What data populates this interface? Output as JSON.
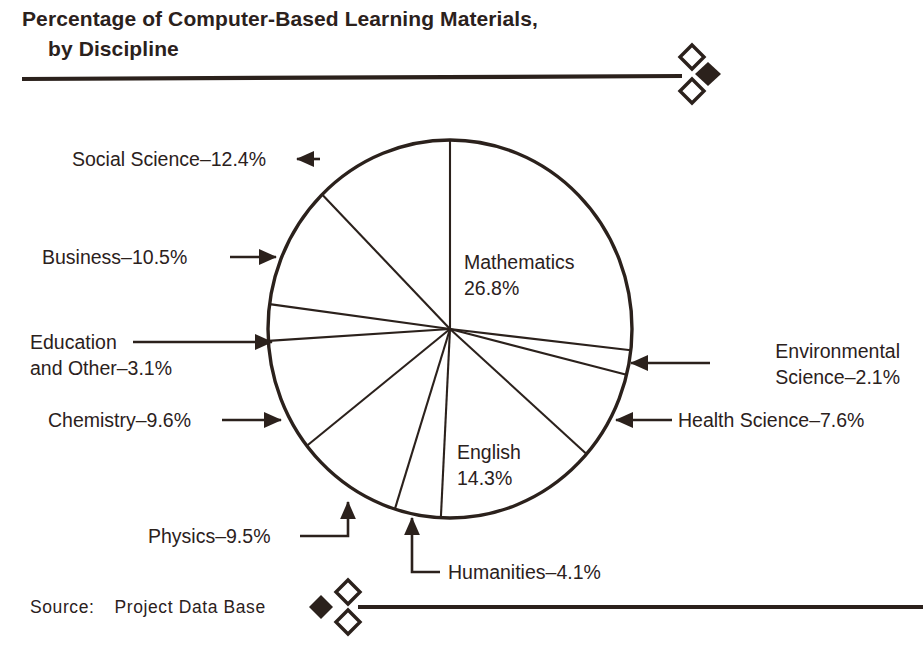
{
  "title": {
    "line1": "Percentage of Computer-Based Learning Materials,",
    "line2": "by Discipline"
  },
  "source": {
    "label": "Source:",
    "value": "Project Data Base"
  },
  "ornaments": {
    "top": "diamond-rule-ornament",
    "bottom": "diamond-rule-ornament"
  },
  "colors": {
    "ink": "#2b211c",
    "background": "#ffffff"
  },
  "chart_data": {
    "type": "pie",
    "title": "Percentage of Computer-Based Learning Materials, by Discipline",
    "subtitle": "",
    "xlabel": "",
    "ylabel": "",
    "units": "percent",
    "start_angle_deg": 0,
    "direction": "clockwise",
    "legend": "none",
    "labels_inside": [
      "Mathematics",
      "English"
    ],
    "categories": [
      "Mathematics",
      "Environmental Science",
      "Health Science",
      "English",
      "Humanities",
      "Physics",
      "Chemistry",
      "Education and Other",
      "Business",
      "Social Science"
    ],
    "values": [
      26.8,
      2.1,
      7.6,
      14.3,
      4.1,
      9.5,
      9.6,
      3.1,
      10.5,
      12.4
    ],
    "slices": [
      {
        "name": "Mathematics",
        "value": 26.8,
        "label": "Mathematics",
        "value_label": "26.8%",
        "callout": "inside"
      },
      {
        "name": "Environmental Science",
        "value": 2.1,
        "label": "Environmental",
        "value_label": "Science–2.1%",
        "callout": "right"
      },
      {
        "name": "Health Science",
        "value": 7.6,
        "label": "Health Science–7.6%",
        "value_label": "7.6%",
        "callout": "right"
      },
      {
        "name": "English",
        "value": 14.3,
        "label": "English",
        "value_label": "14.3%",
        "callout": "inside"
      },
      {
        "name": "Humanities",
        "value": 4.1,
        "label": "Humanities–4.1%",
        "value_label": "4.1%",
        "callout": "bottom"
      },
      {
        "name": "Physics",
        "value": 9.5,
        "label": "Physics–9.5%",
        "value_label": "9.5%",
        "callout": "bottom-left"
      },
      {
        "name": "Chemistry",
        "value": 9.6,
        "label": "Chemistry–9.6%",
        "value_label": "9.6%",
        "callout": "left"
      },
      {
        "name": "Education and Other",
        "value": 3.1,
        "label": "Education",
        "value_label": "and Other–3.1%",
        "callout": "left"
      },
      {
        "name": "Business",
        "value": 10.5,
        "label": "Business–10.5%",
        "value_label": "10.5%",
        "callout": "left"
      },
      {
        "name": "Social Science",
        "value": 12.4,
        "label": "Social Science–12.4%",
        "value_label": "12.4%",
        "callout": "top-left"
      }
    ]
  },
  "callouts": {
    "social_science": "Social Science–12.4%",
    "business": "Business–10.5%",
    "education_l1": "Education",
    "education_l2": "and Other–3.1%",
    "chemistry": "Chemistry–9.6%",
    "physics": "Physics–9.5%",
    "humanities": "Humanities–4.1%",
    "environmental_l1": "Environmental",
    "environmental_l2": "Science–2.1%",
    "health_science": "Health Science–7.6%",
    "mathematics_l1": "Mathematics",
    "mathematics_l2": "26.8%",
    "english_l1": "English",
    "english_l2": "14.3%"
  }
}
